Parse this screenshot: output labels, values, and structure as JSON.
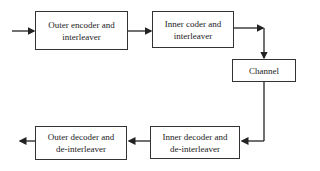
{
  "diagram": {
    "type": "block-diagram",
    "blocks": [
      {
        "id": "outer-encoder",
        "line1": "Outer encoder and",
        "line2": "interleaver"
      },
      {
        "id": "inner-coder",
        "line1": "Inner coder and",
        "line2": "interleaver"
      },
      {
        "id": "channel",
        "line1": "Channel",
        "line2": ""
      },
      {
        "id": "inner-decoder",
        "line1": "Inner decoder and",
        "line2": "de-interleaver"
      },
      {
        "id": "outer-decoder",
        "line1": "Outer decoder and",
        "line2": "de-interleaver"
      }
    ],
    "edges": [
      [
        "input",
        "outer-encoder"
      ],
      [
        "outer-encoder",
        "inner-coder"
      ],
      [
        "inner-coder",
        "channel"
      ],
      [
        "channel",
        "inner-decoder"
      ],
      [
        "inner-decoder",
        "outer-decoder"
      ],
      [
        "outer-decoder",
        "output"
      ]
    ]
  }
}
